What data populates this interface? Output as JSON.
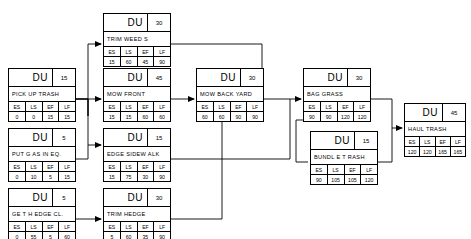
{
  "diagram": {
    "du_label": "DU",
    "columns": [
      "ES",
      "LS",
      "EF",
      "LF"
    ],
    "line_color": "#000000"
  },
  "nodes": [
    {
      "id": "trim-weeds",
      "name": "TRIM  WEED S",
      "du": "30",
      "es": "15",
      "ls": "60",
      "ef": "45",
      "lf": "90",
      "x": 103,
      "y": 13,
      "w": 68
    },
    {
      "id": "pick-up-trash",
      "name": "PICK UP TRASH",
      "du": "15",
      "es": "0",
      "ls": "0",
      "ef": "15",
      "lf": "15",
      "x": 8,
      "y": 68,
      "w": 68
    },
    {
      "id": "mow-front",
      "name": "MOW  FRONT",
      "du": "45",
      "es": "15",
      "ls": "15",
      "ef": "60",
      "lf": "60",
      "x": 103,
      "y": 68,
      "w": 68
    },
    {
      "id": "mow-back-yard",
      "name": "MOW  BACK  YARD",
      "du": "30",
      "es": "60",
      "ls": "60",
      "ef": "90",
      "lf": "90",
      "x": 196,
      "y": 68,
      "w": 68
    },
    {
      "id": "bag-grass",
      "name": "BAG  GRASS",
      "du": "30",
      "es": "90",
      "ls": "90",
      "ef": "120",
      "lf": "120",
      "x": 303,
      "y": 68,
      "w": 68
    },
    {
      "id": "haul-trash",
      "name": "HAUL  TRASH",
      "du": "45",
      "es": "120",
      "ls": "120",
      "ef": "165",
      "lf": "165",
      "x": 404,
      "y": 103,
      "w": 62
    },
    {
      "id": "put-gas-in-eq",
      "name": "PUT G AS  IN  EQ.",
      "du": "5",
      "es": "0",
      "ls": "10",
      "ef": "5",
      "lf": "15",
      "x": 8,
      "y": 128,
      "w": 68
    },
    {
      "id": "edge-sidewalk",
      "name": "EDGE   SIDEW  ALK",
      "du": "15",
      "es": "15",
      "ls": "75",
      "ef": "30",
      "lf": "90",
      "x": 103,
      "y": 128,
      "w": 68
    },
    {
      "id": "bundle-trash",
      "name": "BUNDL E T RASH",
      "du": "15",
      "es": "90",
      "ls": "105",
      "ef": "105",
      "lf": "120",
      "x": 310,
      "y": 131,
      "w": 68
    },
    {
      "id": "get-hedge-cl",
      "name": "GE T H EDGE    CL.",
      "du": "5",
      "es": "0",
      "ls": "55",
      "ef": "5",
      "lf": "60",
      "x": 8,
      "y": 188,
      "w": 68
    },
    {
      "id": "trim-hedge",
      "name": "TRIM   HEDGE",
      "du": "30",
      "es": "5",
      "ls": "60",
      "ef": "35",
      "lf": "90",
      "x": 103,
      "y": 188,
      "w": 68
    }
  ]
}
